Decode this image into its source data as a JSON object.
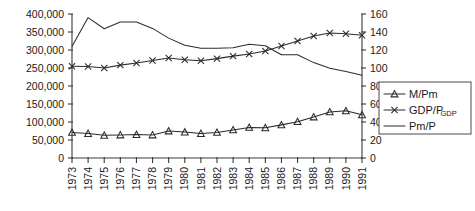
{
  "chart_data": {
    "type": "line",
    "title": "",
    "subtitle": "",
    "xlabel": "",
    "ylabel": "",
    "y2label": "",
    "grid": false,
    "legend_position": "right",
    "categories": [
      "1973",
      "1974",
      "1975",
      "1976",
      "1977",
      "1978",
      "1979",
      "1980",
      "1981",
      "1982",
      "1983",
      "1984",
      "1985",
      "1986",
      "1987",
      "1988",
      "1989",
      "1990",
      "1991"
    ],
    "x": [
      1973,
      1974,
      1975,
      1976,
      1977,
      1978,
      1979,
      1980,
      1981,
      1982,
      1983,
      1984,
      1985,
      1986,
      1987,
      1988,
      1989,
      1990,
      1991
    ],
    "ylim": [
      0,
      400000
    ],
    "yticks": [
      0,
      50000,
      100000,
      150000,
      200000,
      250000,
      300000,
      350000,
      400000
    ],
    "ytick_labels": [
      "0",
      "50,000",
      "100,000",
      "150,000",
      "200,000",
      "250,000",
      "300,000",
      "350,000",
      "400,000"
    ],
    "y2lim": [
      0,
      160
    ],
    "y2ticks": [
      0,
      20,
      40,
      60,
      80,
      100,
      120,
      140,
      160
    ],
    "y2tick_labels": [
      "0",
      "20",
      "40",
      "60",
      "80",
      "100",
      "120",
      "140",
      "160"
    ],
    "series": [
      {
        "name": "M/Pm",
        "axis": "left",
        "marker": "triangle",
        "values": [
          71000,
          68000,
          63000,
          64000,
          65000,
          64000,
          75000,
          72000,
          68000,
          71000,
          78000,
          85000,
          84000,
          92000,
          101000,
          114000,
          128000,
          131000,
          120000
        ]
      },
      {
        "name": "GDP/P_GDP",
        "axis": "left",
        "marker": "x",
        "values": [
          255000,
          254000,
          250000,
          258000,
          264000,
          271000,
          278000,
          273000,
          270000,
          276000,
          283000,
          289000,
          297000,
          311000,
          325000,
          339000,
          347000,
          345000,
          341000
        ]
      },
      {
        "name": "Pm/P",
        "axis": "left",
        "marker": "none",
        "values": [
          310000,
          390000,
          359000,
          378000,
          378000,
          360000,
          333000,
          313000,
          305000,
          305000,
          306000,
          316000,
          312000,
          287000,
          287000,
          265000,
          249000,
          240000,
          230000
        ]
      }
    ],
    "legend": [
      {
        "label": "M/Pm",
        "marker": "triangle",
        "sub": ""
      },
      {
        "label": "GDP/P",
        "marker": "x",
        "sub": "GDP"
      },
      {
        "label": "Pm/P",
        "marker": "none",
        "sub": ""
      }
    ],
    "colors": {
      "line": "#2b2b2b",
      "axis": "#3a3a3a",
      "background": "#ffffff",
      "legend_border": "#4a4a4a"
    }
  }
}
